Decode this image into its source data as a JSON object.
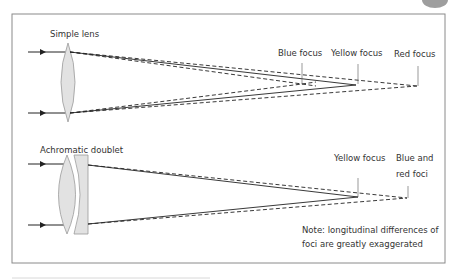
{
  "colors": {
    "background": "#ffffff",
    "frame": "#8a8a8a",
    "ray": "#222222",
    "lens_fill": "#e2e2e2",
    "lens_stroke": "#9a9a9a",
    "text": "#333333",
    "corner_tab": "#9e9e9e"
  },
  "simple_lens": {
    "title": "Simple lens",
    "labels": {
      "blue": "Blue focus",
      "yellow": "Yellow focus",
      "red": "Red focus"
    }
  },
  "achromatic_doublet": {
    "title": "Achromatic doublet",
    "labels": {
      "yellow": "Yellow focus",
      "blue_red_line1": "Blue and",
      "blue_red_line2": "red foci"
    }
  },
  "note": {
    "line1": "Note: longitudinal differences of",
    "line2": "foci are greatly exaggerated"
  }
}
